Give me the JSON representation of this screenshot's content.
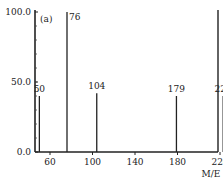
{
  "chart_data": {
    "type": "bar",
    "title": "",
    "panel_label": "(a)",
    "xlabel": "M/E",
    "ylabel": "",
    "x_ticks": [
      60,
      100,
      140,
      180,
      220
    ],
    "y_ticks": [
      "0.0",
      "50.0",
      "100.0"
    ],
    "xlim": [
      40,
      225
    ],
    "ylim": [
      0,
      100
    ],
    "peaks": [
      {
        "mz": 50,
        "intensity": 40,
        "label": "50"
      },
      {
        "mz": 76,
        "intensity": 100,
        "label": "76"
      },
      {
        "mz": 104,
        "intensity": 42,
        "label": "104"
      },
      {
        "mz": 179,
        "intensity": 40,
        "label": "179"
      },
      {
        "mz": 223,
        "intensity": 40,
        "label": "223"
      }
    ],
    "grid": false
  }
}
